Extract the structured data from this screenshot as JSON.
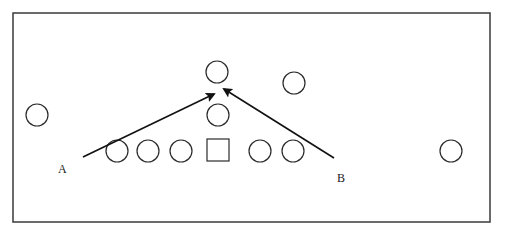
{
  "diagram": {
    "frame": {
      "x": 13,
      "y": 13,
      "width": 477,
      "height": 209,
      "stroke": "#3a3a3a"
    },
    "stroke_color": "#2a2a2a",
    "circle_radius": 11,
    "circles": [
      {
        "id": "left-far",
        "cx": 37,
        "cy": 115
      },
      {
        "id": "top-center",
        "cx": 217,
        "cy": 72
      },
      {
        "id": "top-right",
        "cx": 294,
        "cy": 83
      },
      {
        "id": "middle-center",
        "cx": 218,
        "cy": 115
      },
      {
        "id": "line-1",
        "cx": 117,
        "cy": 151
      },
      {
        "id": "line-2",
        "cx": 148,
        "cy": 151
      },
      {
        "id": "line-3",
        "cx": 181,
        "cy": 151
      },
      {
        "id": "line-5",
        "cx": 260,
        "cy": 151
      },
      {
        "id": "line-6",
        "cx": 293,
        "cy": 151
      },
      {
        "id": "right-far",
        "cx": 451,
        "cy": 151
      }
    ],
    "square": {
      "x": 207,
      "y": 139,
      "size": 22
    },
    "arrows": [
      {
        "id": "A",
        "x1": 83,
        "y1": 157,
        "x2": 214,
        "y2": 94
      },
      {
        "id": "B",
        "x1": 334,
        "y1": 158,
        "x2": 224,
        "y2": 89
      }
    ],
    "labels": [
      {
        "id": "A",
        "text": "A",
        "x": 58,
        "y": 173
      },
      {
        "id": "B",
        "text": "B",
        "x": 337,
        "y": 182
      }
    ]
  }
}
